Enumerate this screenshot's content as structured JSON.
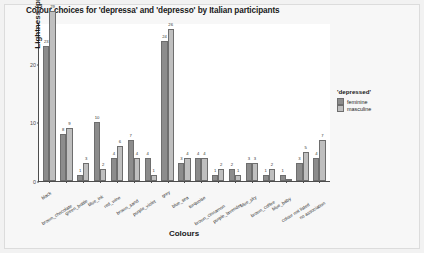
{
  "chart_data": {
    "type": "bar",
    "title": "Colour choices for 'depressa' and 'depresso' by Italian participants",
    "xlabel": "Colours",
    "ylabel": "Lightness (predicted)",
    "ylim": [
      0,
      27
    ],
    "yticks": [
      0,
      10,
      20
    ],
    "ytick_labels": [
      "0",
      "10",
      "20"
    ],
    "grid": false,
    "legend_position": "right",
    "legend_title": "'depressed'",
    "categories": [
      "black",
      "brown_chocolate",
      "green_bottle",
      "blue_ink",
      "red_wine",
      "brown_sand",
      "purple_violet",
      "grey",
      "blue_sea",
      "turquoise",
      "brown_cinnamon",
      "purple_lavender",
      "blue_sky",
      "brown_coffee",
      "blue_baby",
      "colour not listed",
      "no association"
    ],
    "series": [
      {
        "name": "feminine",
        "color": "#8c8c8c",
        "values": [
          23,
          8,
          1,
          10,
          4,
          7,
          4,
          24,
          3,
          4,
          1,
          2,
          3,
          1,
          1,
          3,
          4
        ]
      },
      {
        "name": "masculine",
        "color": "#bfbfbf",
        "values": [
          29,
          9,
          3,
          2,
          6,
          4,
          1,
          26,
          4,
          4,
          2,
          1,
          3,
          2,
          0,
          5,
          7
        ]
      }
    ]
  },
  "legend": {
    "title": "'depressed'",
    "items": [
      {
        "label": "feminine"
      },
      {
        "label": "masculine"
      }
    ]
  }
}
